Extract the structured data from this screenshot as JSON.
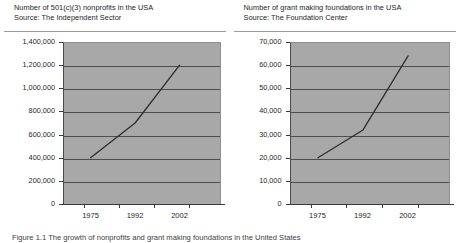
{
  "figure": {
    "caption": "Figure 1.1  The growth of nonprofits and grant making foundations in the United States"
  },
  "panels": [
    {
      "title": "Number of 501(c)(3) nonprofits in the USA",
      "source": "Source: The Independent Sector",
      "chart_data": {
        "type": "line",
        "title": "Number of 501(c)(3) nonprofits in the USA",
        "subtitle": "Source: The Independent Sector",
        "xlabel": "",
        "ylabel": "",
        "categories": [
          "1975",
          "1992",
          "2002"
        ],
        "x": [
          1975,
          1992,
          2002
        ],
        "values": [
          400000,
          700000,
          1200000
        ],
        "ylim": [
          0,
          1400000
        ],
        "ytick_values": [
          0,
          200000,
          400000,
          600000,
          800000,
          1000000,
          1200000,
          1400000
        ],
        "ytick_labels": [
          "0",
          "200,000",
          "400,000",
          "600,000",
          "800,000",
          "1,000,000",
          "1,200,000",
          "1,400,000"
        ],
        "grid": true,
        "legend": "none",
        "series": [
          {
            "name": "501(c)(3) nonprofits",
            "values": [
              400000,
              700000,
              1200000
            ]
          }
        ],
        "line_color": "#2e2e2e",
        "plot_background": "#a8a8a8"
      }
    },
    {
      "title": "Number of grant making foundations in the USA",
      "source": "Source: The Foundation Center",
      "chart_data": {
        "type": "line",
        "title": "Number of grant making foundations in the USA",
        "subtitle": "Source: The Foundation Center",
        "xlabel": "",
        "ylabel": "",
        "categories": [
          "1975",
          "1992",
          "2002"
        ],
        "x": [
          1975,
          1992,
          2002
        ],
        "values": [
          20000,
          32000,
          64000
        ],
        "ylim": [
          0,
          70000
        ],
        "ytick_values": [
          0,
          10000,
          20000,
          30000,
          40000,
          50000,
          60000,
          70000
        ],
        "ytick_labels": [
          "0",
          "10,000",
          "20,000",
          "30,000",
          "40,000",
          "50,000",
          "60,000",
          "70,000"
        ],
        "grid": true,
        "legend": "none",
        "series": [
          {
            "name": "Grant making foundations",
            "values": [
              20000,
              32000,
              64000
            ]
          }
        ],
        "line_color": "#2e2e2e",
        "plot_background": "#a8a8a8"
      }
    }
  ]
}
